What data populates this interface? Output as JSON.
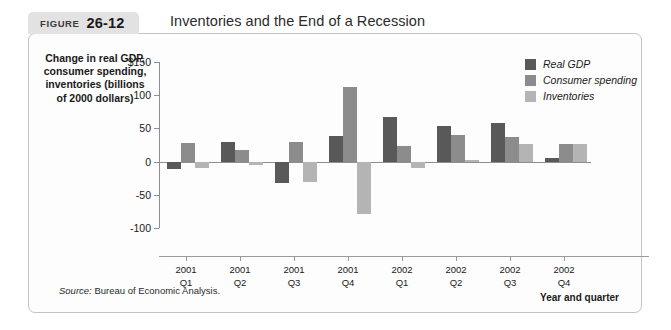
{
  "figure": {
    "label_word": "FIGURE",
    "number": "26-12",
    "title": "Inventories and the End of a Recession",
    "source_prefix": "Source:",
    "source_text": "Bureau of Economic Analysis."
  },
  "chart_data": {
    "type": "bar",
    "title": "Inventories and the End of a Recession",
    "xlabel": "Year and quarter",
    "ylabel": "Change in real GDP, consumer spending, inventories (billions of 2000 dollars)",
    "ylim": [
      -100,
      150
    ],
    "yticks": [
      -100,
      -50,
      0,
      50,
      100,
      150
    ],
    "ytick_labels": [
      "-100",
      "-50",
      "0",
      "50",
      "100",
      "$150"
    ],
    "grid": false,
    "legend_position": "top-right",
    "categories": [
      "2001 Q1",
      "2001 Q2",
      "2001 Q3",
      "2001 Q4",
      "2002 Q1",
      "2002 Q2",
      "2002 Q3",
      "2002 Q4"
    ],
    "category_lines": [
      [
        "2001",
        "Q1"
      ],
      [
        "2001",
        "Q2"
      ],
      [
        "2001",
        "Q3"
      ],
      [
        "2001",
        "Q4"
      ],
      [
        "2002",
        "Q1"
      ],
      [
        "2002",
        "Q2"
      ],
      [
        "2002",
        "Q3"
      ],
      [
        "2002",
        "Q4"
      ]
    ],
    "series": [
      {
        "name": "Real GDP",
        "color": "#595959",
        "values": [
          -11,
          30,
          -32,
          38,
          67,
          54,
          58,
          6
        ]
      },
      {
        "name": "Consumer spending",
        "color": "#8c8c8c",
        "values": [
          28,
          17,
          29,
          113,
          24,
          40,
          37,
          26
        ]
      },
      {
        "name": "Inventories",
        "color": "#b4b4b4",
        "values": [
          -9,
          -5,
          -30,
          -79,
          -10,
          2,
          27,
          26
        ]
      }
    ]
  },
  "legend": {
    "items": [
      {
        "label": "Real GDP"
      },
      {
        "label": "Consumer spending"
      },
      {
        "label": "Inventories"
      }
    ]
  },
  "colors": {
    "real_gdp": "#595959",
    "consumer_spending": "#8c8c8c",
    "inventories": "#b4b4b4",
    "axis": "#8e8e8e",
    "tab_background": "#e2e2e2",
    "panel_border": "#c3c3c3"
  }
}
